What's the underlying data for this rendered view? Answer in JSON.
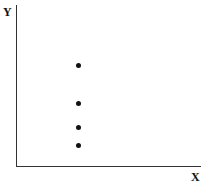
{
  "chart_data": {
    "type": "scatter",
    "title": "",
    "xlabel": "X",
    "ylabel": "Y",
    "grid": false,
    "legend": null,
    "points": [
      {
        "x": 0.34,
        "y": 0.63
      },
      {
        "x": 0.34,
        "y": 0.39
      },
      {
        "x": 0.34,
        "y": 0.25
      },
      {
        "x": 0.34,
        "y": 0.13
      }
    ],
    "pixel_points": [
      {
        "left": 78,
        "top": 65
      },
      {
        "left": 78,
        "top": 103
      },
      {
        "left": 78,
        "top": 127
      },
      {
        "left": 78,
        "top": 145
      }
    ]
  }
}
